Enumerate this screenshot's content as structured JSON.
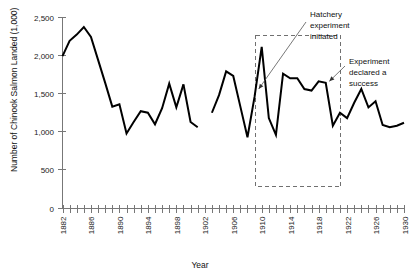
{
  "chart_data": {
    "type": "line",
    "title": "",
    "xlabel": "Year",
    "ylabel": "Number of Chinook Salmon Landed (1,000)",
    "xlim": [
      1882,
      1930
    ],
    "ylim": [
      0,
      2500
    ],
    "yticks": [
      0,
      500,
      1000,
      1500,
      2000,
      2500
    ],
    "ytick_labels": [
      "0",
      "500",
      "1,000",
      "1,500",
      "2,000",
      "2,500"
    ],
    "xtick_labels": [
      "1882",
      "1886",
      "1890",
      "1894",
      "1898",
      "1902",
      "1906",
      "1910",
      "1914",
      "1918",
      "1922",
      "1926",
      "1930"
    ],
    "xtick_values": [
      1882,
      1886,
      1890,
      1894,
      1898,
      1902,
      1906,
      1910,
      1914,
      1918,
      1922,
      1926,
      1930
    ],
    "minor_tick_step": 1,
    "grid": false,
    "legend": null,
    "series": [
      {
        "name": "Chinook salmon landed",
        "x": [
          1882,
          1883,
          1884,
          1885,
          1886,
          1887,
          1888,
          1889,
          1890,
          1891,
          1892,
          1893,
          1894,
          1895,
          1896,
          1897,
          1898,
          1899
        ],
        "values": [
          1990,
          2190,
          2270,
          2370,
          2240,
          1940,
          1640,
          1330,
          1360,
          980,
          1130,
          1270,
          1250,
          1100,
          1310,
          1630,
          1320,
          1620
        ]
      },
      {
        "name": "Chinook salmon landed (continued)",
        "x": [
          1899,
          1900,
          1901
        ],
        "values": [
          1620,
          1130,
          1060
        ]
      },
      {
        "name": "Chinook salmon landed (post-gap)",
        "x": [
          1903,
          1904,
          1905,
          1906,
          1907,
          1908,
          1909,
          1910,
          1911,
          1912,
          1913,
          1914,
          1915,
          1916,
          1917,
          1918,
          1919,
          1920,
          1921,
          1922,
          1923,
          1924,
          1925,
          1926,
          1927,
          1928,
          1929,
          1930
        ],
        "values": [
          1250,
          1480,
          1790,
          1730,
          1330,
          930,
          1460,
          2110,
          1180,
          960,
          1760,
          1700,
          1700,
          1560,
          1540,
          1660,
          1640,
          1080,
          1250,
          1180,
          1380,
          1560,
          1320,
          1400,
          1090,
          1060,
          1080,
          1120
        ]
      }
    ],
    "annotations": [
      {
        "id": "hatchery-experiment-initiated",
        "text": "Hatchery experiment initiated",
        "lines": [
          "Hatchery",
          "experiment",
          "initiated"
        ],
        "points_to_year": 1910
      },
      {
        "id": "experiment-declared-success",
        "text": "Experiment declared a success",
        "lines": [
          "Experiment",
          "declared a",
          "success"
        ],
        "points_to_year": 1920
      }
    ],
    "highlight_box": {
      "id": "experiment-period-box",
      "x_start": 1909,
      "x_end": 1921,
      "y_start": 300,
      "y_end": 2260,
      "style": "dashed"
    },
    "colors": {
      "line": "#000000",
      "axis": "#777777",
      "box": "#707070",
      "text": "#111111",
      "background": "#ffffff"
    }
  }
}
